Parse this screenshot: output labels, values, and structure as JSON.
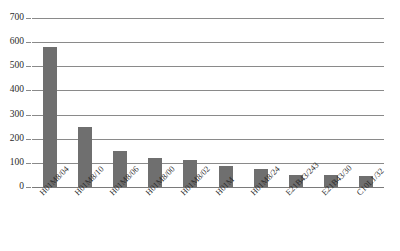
{
  "chart_data": {
    "type": "bar",
    "title": "",
    "subtitle": "",
    "xlabel": "",
    "ylabel": "",
    "ylim": [
      0,
      700
    ],
    "ytick_step": 100,
    "yticks": [
      0,
      100,
      200,
      300,
      400,
      500,
      600,
      700
    ],
    "ytick_labels": [
      "0",
      "100",
      "200",
      "300",
      "400",
      "500",
      "600",
      "700"
    ],
    "grid": "horizontal",
    "legend": "none",
    "bar_color": "#6f6f6f",
    "gridline_color": "#8a8a8a",
    "xtick_rotation_deg": -45,
    "categories": [
      "H01M8/04",
      "H01M8/10",
      "H01M8/06",
      "H01M8/00",
      "H01M8/02",
      "H01M",
      "H01M8/24",
      "E21B43/243",
      "E21B43/30",
      "C10L1/32"
    ],
    "values": [
      580,
      250,
      150,
      120,
      110,
      85,
      75,
      50,
      50,
      45
    ],
    "series": [
      {
        "name": "count",
        "values": [
          580,
          250,
          150,
          120,
          110,
          85,
          75,
          50,
          50,
          45
        ]
      }
    ],
    "annotations": []
  }
}
